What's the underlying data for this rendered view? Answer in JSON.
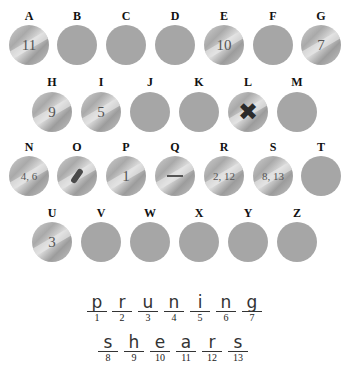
{
  "puzzle": {
    "coins": [
      {
        "letter": "A",
        "value": "11",
        "state": "revealed"
      },
      {
        "letter": "B",
        "value": "",
        "state": "hidden"
      },
      {
        "letter": "C",
        "value": "",
        "state": "hidden"
      },
      {
        "letter": "D",
        "value": "",
        "state": "hidden"
      },
      {
        "letter": "E",
        "value": "10",
        "state": "revealed"
      },
      {
        "letter": "F",
        "value": "",
        "state": "hidden"
      },
      {
        "letter": "G",
        "value": "7",
        "state": "revealed"
      },
      {
        "letter": "H",
        "value": "9",
        "state": "revealed"
      },
      {
        "letter": "I",
        "value": "5",
        "state": "revealed"
      },
      {
        "letter": "J",
        "value": "",
        "state": "hidden"
      },
      {
        "letter": "K",
        "value": "",
        "state": "hidden"
      },
      {
        "letter": "L",
        "value": "✖",
        "state": "crossed"
      },
      {
        "letter": "M",
        "value": "",
        "state": "hidden"
      },
      {
        "letter": "N",
        "value": "4, 6",
        "state": "revealed"
      },
      {
        "letter": "O",
        "value": "",
        "state": "scratched"
      },
      {
        "letter": "P",
        "value": "1",
        "state": "revealed"
      },
      {
        "letter": "Q",
        "value": "",
        "state": "scratched"
      },
      {
        "letter": "R",
        "value": "2, 12",
        "state": "revealed"
      },
      {
        "letter": "S",
        "value": "8, 13",
        "state": "revealed"
      },
      {
        "letter": "T",
        "value": "",
        "state": "hidden"
      },
      {
        "letter": "U",
        "value": "3",
        "state": "revealed"
      },
      {
        "letter": "V",
        "value": "",
        "state": "hidden"
      },
      {
        "letter": "W",
        "value": "",
        "state": "hidden"
      },
      {
        "letter": "X",
        "value": "",
        "state": "hidden"
      },
      {
        "letter": "Y",
        "value": "",
        "state": "hidden"
      },
      {
        "letter": "Z",
        "value": "",
        "state": "hidden"
      }
    ],
    "answer": {
      "word1": [
        {
          "letter": "p",
          "index": "1"
        },
        {
          "letter": "r",
          "index": "2"
        },
        {
          "letter": "u",
          "index": "3"
        },
        {
          "letter": "n",
          "index": "4"
        },
        {
          "letter": "i",
          "index": "5"
        },
        {
          "letter": "n",
          "index": "6"
        },
        {
          "letter": "g",
          "index": "7"
        }
      ],
      "word2": [
        {
          "letter": "s",
          "index": "8"
        },
        {
          "letter": "h",
          "index": "9"
        },
        {
          "letter": "e",
          "index": "10"
        },
        {
          "letter": "a",
          "index": "11"
        },
        {
          "letter": "r",
          "index": "12"
        },
        {
          "letter": "s",
          "index": "13"
        }
      ]
    }
  }
}
